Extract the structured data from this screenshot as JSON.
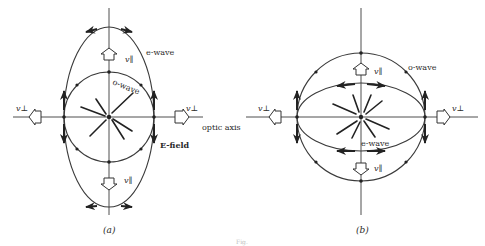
{
  "figure": {
    "caption": "Fig.",
    "panels": [
      {
        "id": "a",
        "label": "(a)",
        "center": [
          109,
          117
        ],
        "o_wave": {
          "label": "o-wave",
          "shape": "circle",
          "r": 45
        },
        "e_wave": {
          "label": "e-wave",
          "shape": "ellipse",
          "rx": 45,
          "ry": 90
        },
        "v_parallel_label": "v∥",
        "v_perp_label": "v⊥",
        "optic_axis_label": "optic axis",
        "e_field_label": "E-field"
      },
      {
        "id": "b",
        "label": "(b)",
        "center": [
          361,
          117
        ],
        "o_wave": {
          "label": "o-wave",
          "shape": "circle",
          "r": 64
        },
        "e_wave": {
          "label": "e-wave",
          "shape": "ellipse",
          "rx": 64,
          "ry": 34
        },
        "v_parallel_label": "v∥",
        "v_perp_label": "v⊥"
      }
    ]
  },
  "colors": {
    "ink": "#2a2a2a",
    "background": "#ffffff"
  }
}
